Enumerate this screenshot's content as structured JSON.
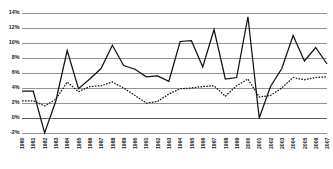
{
  "chart_data": {
    "type": "line",
    "title": "",
    "subtitle": "",
    "xlabel": "",
    "ylabel": "",
    "grid": true,
    "legend_position": "none",
    "ylim": [
      -2,
      14
    ],
    "ytick_labels": [
      "14%",
      "12%",
      "10%",
      "8%",
      "6%",
      "4%",
      "2%",
      "0%",
      "-2%"
    ],
    "ytick_values": [
      14,
      12,
      10,
      8,
      6,
      4,
      2,
      0,
      -2
    ],
    "categories": [
      "1980",
      "1981",
      "1982",
      "1983",
      "1984",
      "1985",
      "1986",
      "1987",
      "1988",
      "1989",
      "1990",
      "1991",
      "1992",
      "1993",
      "1994",
      "1995",
      "1996",
      "1997",
      "1998",
      "1999",
      "2000",
      "2001",
      "2002",
      "2003",
      "2004",
      "2005",
      "2006",
      "2007"
    ],
    "series": [
      {
        "name": "series-solid",
        "style": "solid",
        "color": "#111111",
        "values": [
          3.6,
          3.6,
          -2.0,
          2.3,
          9.0,
          3.9,
          5.2,
          6.6,
          9.7,
          7.0,
          6.5,
          5.5,
          5.6,
          4.9,
          10.2,
          10.3,
          6.8,
          11.8,
          5.2,
          5.4,
          13.5,
          0.0,
          4.2,
          6.6,
          11.0,
          7.6,
          9.4,
          7.2
        ]
      },
      {
        "name": "series-dotted",
        "style": "dotted",
        "color": "#111111",
        "values": [
          2.3,
          2.3,
          1.6,
          2.5,
          4.8,
          3.5,
          4.2,
          4.3,
          4.8,
          4.0,
          3.0,
          2.0,
          2.2,
          3.2,
          3.9,
          4.0,
          4.2,
          4.3,
          2.9,
          4.3,
          5.2,
          2.8,
          3.0,
          4.0,
          5.4,
          5.1,
          5.4,
          5.5
        ]
      }
    ]
  }
}
